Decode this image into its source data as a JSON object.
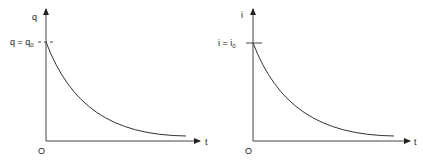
{
  "diagrams": [
    {
      "id": "charge-decay",
      "y_axis_label": "q",
      "x_axis_label": "t",
      "origin_label": "O",
      "initial_label_main": "q = q",
      "initial_label_sub": "0",
      "curve": "exponential decay of charge q from q0 toward 0 over time t"
    },
    {
      "id": "current-decay",
      "y_axis_label": "i",
      "x_axis_label": "t",
      "origin_label": "O",
      "initial_label_main": "i = i",
      "initial_label_sub": "0",
      "curve": "exponential decay of current i from i0 toward 0 over time t"
    }
  ],
  "colors": {
    "line": "#333333",
    "background": "#ffffff"
  }
}
